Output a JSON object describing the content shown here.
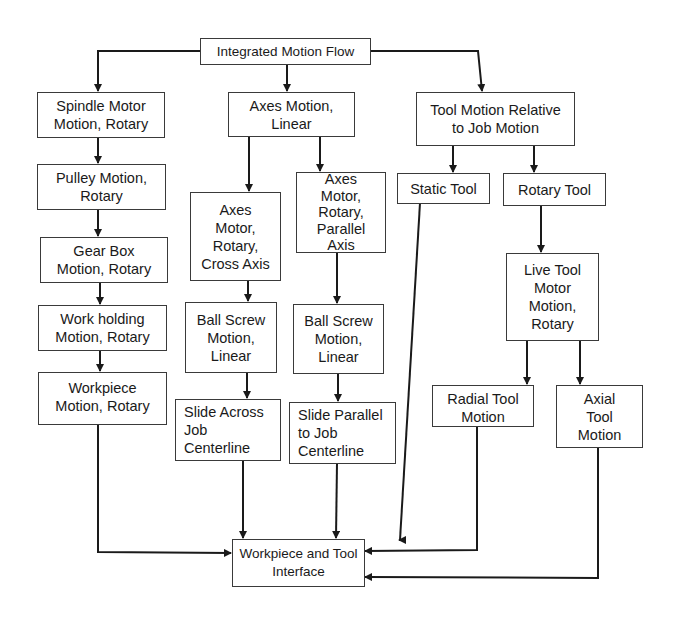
{
  "diagram": {
    "title": "Integrated Motion Flow",
    "nodes": [
      {
        "id": "root",
        "label": "Integrated Motion Flow"
      },
      {
        "id": "spindle",
        "label": "Spindle Motor\nMotion, Rotary"
      },
      {
        "id": "axes_linear",
        "label": "Axes Motion,\nLinear"
      },
      {
        "id": "tool_relative",
        "label": "Tool Motion Relative\nto Job Motion"
      },
      {
        "id": "pulley",
        "label": "Pulley Motion,\nRotary"
      },
      {
        "id": "gearbox",
        "label": "Gear Box\nMotion, Rotary"
      },
      {
        "id": "workholding",
        "label": "Work holding\nMotion, Rotary"
      },
      {
        "id": "workpiece",
        "label": "Workpiece\nMotion, Rotary"
      },
      {
        "id": "axes_motor_cross",
        "label": "Axes\nMotor,\nRotary,\nCross Axis"
      },
      {
        "id": "axes_motor_parallel",
        "label": "Axes\nMotor,\nRotary,\nParallel\nAxis"
      },
      {
        "id": "ballscrew_cross",
        "label": "Ball Screw\nMotion,\nLinear"
      },
      {
        "id": "ballscrew_parallel",
        "label": "Ball Screw\nMotion,\nLinear"
      },
      {
        "id": "slide_across",
        "label": "Slide Across\nJob\nCenterline"
      },
      {
        "id": "slide_parallel",
        "label": "Slide Parallel\nto Job\nCenterline"
      },
      {
        "id": "static_tool",
        "label": "Static Tool"
      },
      {
        "id": "rotary_tool",
        "label": "Rotary Tool"
      },
      {
        "id": "live_tool",
        "label": "Live Tool\nMotor\nMotion,\nRotary"
      },
      {
        "id": "radial_tool",
        "label": "Radial Tool\nMotion"
      },
      {
        "id": "axial_tool",
        "label": "Axial\nTool\nMotion"
      },
      {
        "id": "interface",
        "label": "Workpiece and Tool\nInterface"
      }
    ],
    "edges": [
      [
        "root",
        "spindle"
      ],
      [
        "root",
        "axes_linear"
      ],
      [
        "root",
        "tool_relative"
      ],
      [
        "spindle",
        "pulley"
      ],
      [
        "pulley",
        "gearbox"
      ],
      [
        "gearbox",
        "workholding"
      ],
      [
        "workholding",
        "workpiece"
      ],
      [
        "axes_linear",
        "axes_motor_cross"
      ],
      [
        "axes_linear",
        "axes_motor_parallel"
      ],
      [
        "axes_motor_cross",
        "ballscrew_cross"
      ],
      [
        "axes_motor_parallel",
        "ballscrew_parallel"
      ],
      [
        "ballscrew_cross",
        "slide_across"
      ],
      [
        "ballscrew_parallel",
        "slide_parallel"
      ],
      [
        "tool_relative",
        "static_tool"
      ],
      [
        "tool_relative",
        "rotary_tool"
      ],
      [
        "rotary_tool",
        "live_tool"
      ],
      [
        "live_tool",
        "radial_tool"
      ],
      [
        "live_tool",
        "axial_tool"
      ],
      [
        "workpiece",
        "interface"
      ],
      [
        "slide_across",
        "interface"
      ],
      [
        "slide_parallel",
        "interface"
      ],
      [
        "static_tool",
        "interface"
      ],
      [
        "radial_tool",
        "interface"
      ],
      [
        "axial_tool",
        "interface"
      ]
    ],
    "colors": {
      "line": "#1a1a1a",
      "border": "#3a3a3a",
      "background": "#ffffff"
    }
  }
}
